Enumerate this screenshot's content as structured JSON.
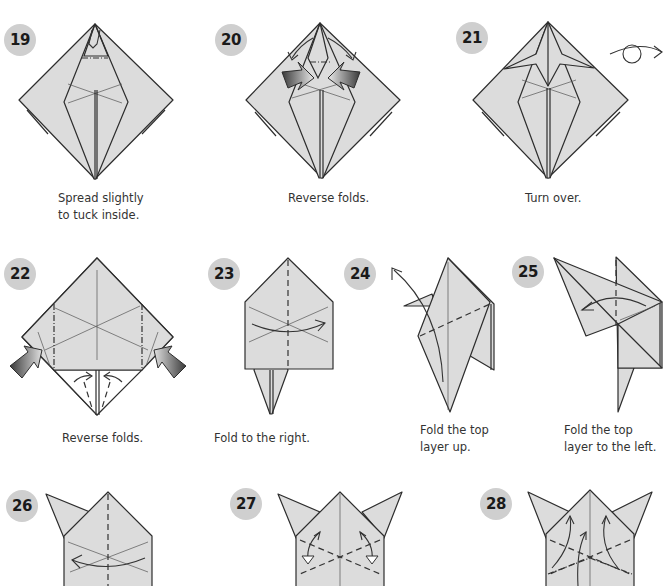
{
  "page": {
    "colors": {
      "paper_fill": "#dcdcdc",
      "line": "#2d2d2d",
      "badge_bg": "#cfcfcf",
      "badge_text": "#1a1a1a",
      "caption_text": "#333333",
      "push_arrow_dark": "#3a3a3a"
    }
  },
  "steps": [
    {
      "number": "19",
      "caption": "Spread slightly\nto tuck inside.",
      "icons": [
        "spread-arrows"
      ]
    },
    {
      "number": "20",
      "caption": "Reverse folds.",
      "icons": [
        "push-arrow-left",
        "push-arrow-right",
        "fold-arrow-left",
        "fold-arrow-right"
      ]
    },
    {
      "number": "21",
      "caption": "Turn over.",
      "icons": [
        "turn-over-icon"
      ]
    },
    {
      "number": "22",
      "caption": "Reverse folds.",
      "icons": [
        "push-arrow-left",
        "push-arrow-right"
      ]
    },
    {
      "number": "23",
      "caption": "Fold to the right.",
      "icons": [
        "fold-arrow-right"
      ]
    },
    {
      "number": "24",
      "caption": "Fold the top\nlayer up.",
      "icons": [
        "fold-arrow-up"
      ]
    },
    {
      "number": "25",
      "caption": "Fold the top\nlayer to the left.",
      "icons": [
        "fold-arrow-left"
      ]
    },
    {
      "number": "26",
      "caption": "",
      "icons": [
        "fold-arrow-left"
      ]
    },
    {
      "number": "27",
      "caption": "",
      "icons": [
        "fold-unfold-arrow-left",
        "fold-unfold-arrow-right"
      ]
    },
    {
      "number": "28",
      "caption": "",
      "icons": [
        "fold-arrow-up"
      ]
    }
  ]
}
